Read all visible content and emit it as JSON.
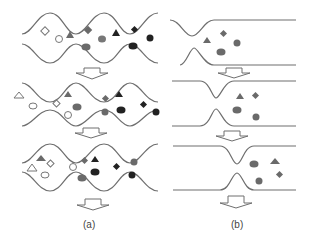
{
  "figure": {
    "panels": [
      {
        "id": "a",
        "label": "(a)",
        "description": "Sinusoidal channel with particles, three stages"
      },
      {
        "id": "b",
        "label": "(b)",
        "description": "Single constriction channel with particles, three stages"
      }
    ],
    "colors": {
      "wall": "#6e6e6e",
      "open_shape_stroke": "#777777",
      "gray_fill": "#7a7a7a",
      "dark_fill": "#1a1a1a",
      "arrow_fill": "#ffffff"
    },
    "shape_types": [
      "open-diamond",
      "open-circle",
      "open-hexagon",
      "open-triangle",
      "gray-triangle",
      "gray-diamond",
      "gray-hexagon",
      "dark-triangle",
      "dark-diamond",
      "dark-hexagon",
      "dark-circle"
    ]
  }
}
